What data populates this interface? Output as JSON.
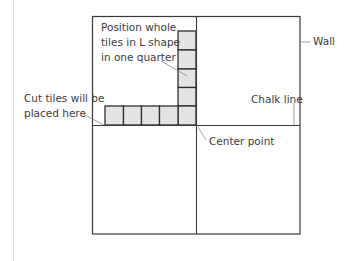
{
  "diagram": {
    "colors": {
      "outline": "#3a3a3a",
      "tile_fill": "#e4e4e4",
      "leader": "#7a7a7a",
      "text": "#3c3c3c"
    },
    "room": {
      "x": 92,
      "y": 16,
      "width": 208,
      "height": 218
    },
    "center_point": {
      "x": 196,
      "y": 125
    },
    "tiles": {
      "size": 18.5,
      "vertical_column": {
        "x": 178,
        "count": 5,
        "start_y": 31
      },
      "horizontal_row": {
        "y": 106,
        "count": 5,
        "start_x": 105
      }
    },
    "labels": {
      "position_tiles_line1": "Position whole",
      "position_tiles_line2": "tiles in L shape",
      "position_tiles_line3": "in one quarter",
      "wall": "Wall",
      "chalk_line": "Chalk line",
      "cut_tiles_line1": "Cut tiles will be",
      "cut_tiles_line2": "placed here",
      "center_point": "Center point"
    }
  }
}
